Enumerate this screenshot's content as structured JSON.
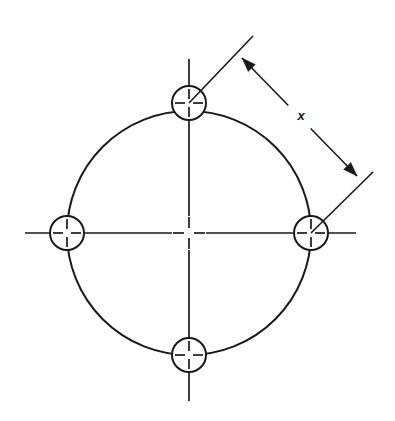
{
  "drawing": {
    "title": "Bolt circle with four holes",
    "type": "engineering-drawing",
    "canvas": {
      "width": 395,
      "height": 421,
      "background": "#ffffff"
    },
    "stroke_color": "#1a1a1a",
    "line_weights": {
      "object_line": 2.0,
      "center_line": 1.7,
      "center_mark": 1.7,
      "extension_line": 1.6,
      "dimension_line": 1.6
    },
    "bolt_circle": {
      "label": "bolt-circle",
      "center_x": 189,
      "center_y": 233,
      "radius": 122
    },
    "center_mark": {
      "label": "center-mark",
      "x": 189,
      "y": 233,
      "arm": 16,
      "gap": 5
    },
    "centerlines": [
      {
        "label": "horizontal-centerline",
        "orientation": "horizontal",
        "start": 25,
        "end": 356,
        "axis": 233,
        "gap_start": 172,
        "gap_end": 206
      },
      {
        "label": "vertical-centerline",
        "orientation": "vertical",
        "start": 59,
        "end": 401,
        "axis": 189,
        "gap_start": 216,
        "gap_end": 250
      }
    ],
    "holes": [
      {
        "id": "hole-top",
        "position": "top",
        "cx": 189,
        "cy": 103,
        "r": 17,
        "mark_arm": 14,
        "mark_gap": 4
      },
      {
        "id": "hole-right",
        "position": "right",
        "cx": 311,
        "cy": 233,
        "r": 17,
        "mark_arm": 14,
        "mark_gap": 4
      },
      {
        "id": "hole-bottom",
        "position": "bottom",
        "cx": 189,
        "cy": 355,
        "r": 17,
        "mark_arm": 14,
        "mark_gap": 4
      },
      {
        "id": "hole-left",
        "position": "left",
        "cx": 67,
        "cy": 233,
        "r": 17,
        "mark_arm": 14,
        "mark_gap": 4
      }
    ],
    "extension_lines": [
      {
        "id": "extension-line-top-hole",
        "from_hole": "hole-top",
        "x1": 189,
        "y1": 103,
        "x2": 253,
        "y2": 36
      },
      {
        "id": "extension-line-right-hole",
        "from_hole": "hole-right",
        "x1": 311,
        "y1": 233,
        "x2": 373,
        "y2": 172
      }
    ],
    "dimension": {
      "id": "dimension-x",
      "label": "x",
      "measures": "chord between top hole center and right hole center",
      "line": {
        "x1": 242,
        "y1": 58,
        "x2": 357,
        "y2": 176
      },
      "label_x": 301,
      "label_y": 117,
      "label_font_size": 13,
      "label_gap": 16,
      "arrow_length": 14,
      "arrow_width": 5,
      "arrow_start_direction": "up-left",
      "arrow_end_direction": "down-right"
    }
  }
}
